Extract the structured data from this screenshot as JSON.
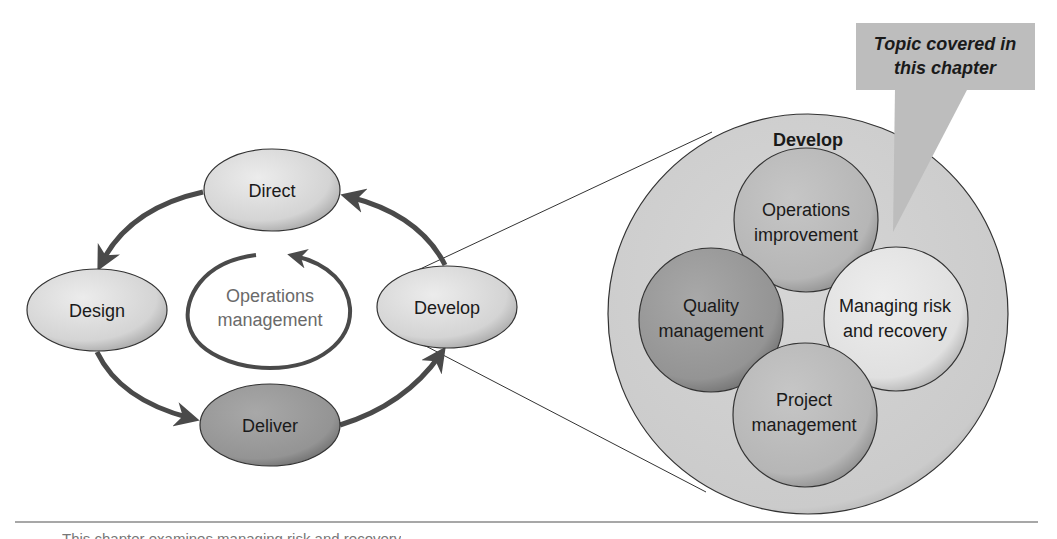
{
  "cycle": {
    "center_label_line1": "Operations",
    "center_label_line2": "management",
    "nodes": {
      "direct": "Direct",
      "design": "Design",
      "deliver": "Deliver",
      "develop": "Develop"
    }
  },
  "detail": {
    "title": "Develop",
    "circles": {
      "ops_improvement_line1": "Operations",
      "ops_improvement_line2": "improvement",
      "quality_line1": "Quality",
      "quality_line2": "management",
      "risk_line1": "Managing risk",
      "risk_line2": "and recovery",
      "project_line1": "Project",
      "project_line2": "management"
    }
  },
  "callout": {
    "line1": "Topic covered in",
    "line2": "this chapter"
  },
  "caption": "This chapter examines managing risk and recovery",
  "colors": {
    "light_node": "#d9d9d9",
    "dark_node": "#9a9a9a",
    "mid_node": "#b8b8b8",
    "outer_circle": "#cfcfcf",
    "highlight_circle": "#e4e4e4",
    "callout": "#bdbdbd",
    "arrow": "#4a4a4a"
  }
}
